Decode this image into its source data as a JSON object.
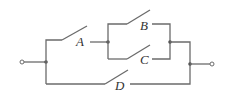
{
  "diagram": {
    "type": "switching-circuit",
    "switches": [
      {
        "id": "A",
        "label": "A",
        "state": "open"
      },
      {
        "id": "B",
        "label": "B",
        "state": "open"
      },
      {
        "id": "C",
        "label": "C",
        "state": "open"
      },
      {
        "id": "D",
        "label": "D",
        "state": "open"
      }
    ],
    "topology": "(A in series with (B parallel C)) in parallel with D",
    "colors": {
      "wire": "#6b6b6b",
      "junction": "#555555",
      "label": "#333333",
      "background": "#ffffff"
    }
  }
}
